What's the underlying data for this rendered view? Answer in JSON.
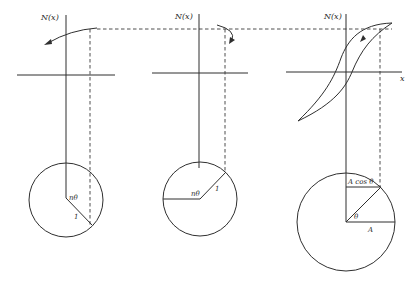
{
  "figure": {
    "panels": [
      {
        "id": "panel-1",
        "axis_label": "N(x)",
        "angle_label": "nθ",
        "radius_label": "1"
      },
      {
        "id": "panel-2",
        "axis_label": "N(x)",
        "angle_label": "nθ",
        "radius_label": "1"
      },
      {
        "id": "panel-3",
        "axis_label": "N(x)",
        "x_axis_label": "x",
        "projection_label": "A cos θ",
        "angle_label": "θ",
        "radius_label": "A"
      }
    ],
    "colors": {
      "ink": "#2f2f2f",
      "background": "#ffffff"
    }
  }
}
